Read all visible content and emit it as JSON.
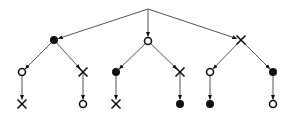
{
  "diagram": {
    "type": "tree",
    "edge_color": "#555555",
    "node_color": "#111111",
    "legend_symbols": {
      "filled": "filled-circle",
      "open": "open-circle",
      "cross": "x-mark"
    },
    "nodes": [
      {
        "id": "root",
        "symbol": "none",
        "x": 148,
        "y": 9
      },
      {
        "id": "a",
        "symbol": "filled",
        "x": 54,
        "y": 40,
        "parent": "root"
      },
      {
        "id": "b",
        "symbol": "open",
        "x": 148,
        "y": 41,
        "parent": "root"
      },
      {
        "id": "c",
        "symbol": "cross",
        "x": 241,
        "y": 40,
        "parent": "root"
      },
      {
        "id": "a1",
        "symbol": "open",
        "x": 22,
        "y": 72,
        "parent": "a"
      },
      {
        "id": "a2",
        "symbol": "cross",
        "x": 83,
        "y": 72,
        "parent": "a"
      },
      {
        "id": "b1",
        "symbol": "filled",
        "x": 116,
        "y": 72,
        "parent": "b"
      },
      {
        "id": "b2",
        "symbol": "cross",
        "x": 180,
        "y": 72,
        "parent": "b"
      },
      {
        "id": "c1",
        "symbol": "open",
        "x": 210,
        "y": 72,
        "parent": "c"
      },
      {
        "id": "c2",
        "symbol": "filled",
        "x": 273,
        "y": 72,
        "parent": "c"
      },
      {
        "id": "a1x",
        "symbol": "cross",
        "x": 22,
        "y": 104,
        "parent": "a1"
      },
      {
        "id": "a2x",
        "symbol": "open",
        "x": 83,
        "y": 104,
        "parent": "a2"
      },
      {
        "id": "b1x",
        "symbol": "cross",
        "x": 116,
        "y": 104,
        "parent": "b1"
      },
      {
        "id": "b2x",
        "symbol": "filled",
        "x": 180,
        "y": 104,
        "parent": "b2"
      },
      {
        "id": "c1x",
        "symbol": "filled",
        "x": 210,
        "y": 104,
        "parent": "c1"
      },
      {
        "id": "c2x",
        "symbol": "open",
        "x": 273,
        "y": 104,
        "parent": "c2"
      }
    ]
  }
}
